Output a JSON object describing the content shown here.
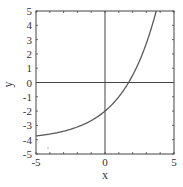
{
  "chart_data": {
    "type": "line",
    "title": "",
    "xlabel": "x",
    "ylabel": "y",
    "xlim": [
      -5,
      5
    ],
    "ylim": [
      -5,
      5
    ],
    "grid": false,
    "axes_through_origin": true,
    "x_ticks": [
      -5,
      0,
      5
    ],
    "y_ticks": [
      -5,
      -4,
      -3,
      -2,
      -1,
      0,
      1,
      2,
      3,
      4,
      5
    ],
    "series": [
      {
        "name": "curve",
        "function": "y = 2*1.5^x - 4",
        "x": [
          -5,
          -4,
          -3,
          -2,
          -1,
          0,
          1,
          2,
          3,
          3.7
        ],
        "y": [
          -3.74,
          -3.6,
          -3.41,
          -3.11,
          -2.67,
          -2.0,
          -1.0,
          0.5,
          2.75,
          5.0
        ],
        "color": "#555555"
      }
    ]
  },
  "colors": {
    "frame": "#444444",
    "curve": "#5a5a5a",
    "text": "#333333"
  }
}
